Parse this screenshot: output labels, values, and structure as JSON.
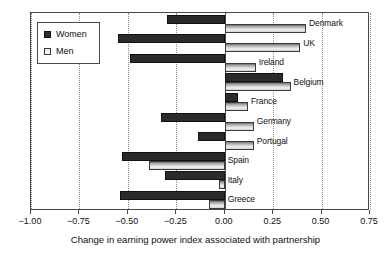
{
  "chart_data": {
    "type": "bar",
    "orientation": "horizontal",
    "title": "",
    "xlabel": "Change in earning power index associated with partnership",
    "ylabel": "",
    "xlim": [
      -1.0,
      0.75
    ],
    "xticks": [
      -1.0,
      -0.75,
      -0.5,
      -0.25,
      0.0,
      0.25,
      0.5,
      0.75
    ],
    "xtick_labels": [
      "−1.00",
      "−0.75",
      "−0.50",
      "−0.25",
      "0.00",
      "0.25",
      "0.50",
      "0.75"
    ],
    "grid": true,
    "grid_style": "dotted-vertical",
    "legend_position": "upper-left",
    "categories": [
      "Denmark",
      "UK",
      "Ireland",
      "Belgium",
      "France",
      "Germany",
      "Portugal",
      "Spain",
      "Italy",
      "Greece"
    ],
    "series": [
      {
        "name": "Women",
        "color": "#2b2b2b",
        "values": [
          -0.3,
          -0.55,
          -0.49,
          0.3,
          0.07,
          -0.33,
          -0.14,
          -0.53,
          -0.31,
          -0.54
        ]
      },
      {
        "name": "Men",
        "color": "#d6d6d6",
        "values": [
          0.42,
          0.39,
          0.16,
          0.34,
          0.12,
          0.15,
          0.15,
          -0.39,
          -0.03,
          -0.08
        ]
      }
    ]
  },
  "legend": {
    "items": [
      {
        "label": "Women",
        "swatch": "women-swatch"
      },
      {
        "label": "Men",
        "swatch": "men-swatch"
      }
    ]
  }
}
